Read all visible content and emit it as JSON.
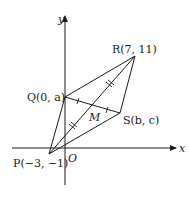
{
  "diagram": {
    "type": "coordinate-geometry",
    "axes": {
      "x_label": "x",
      "y_label": "y",
      "origin_label": "O"
    },
    "points": {
      "P": {
        "label": "P(−3, −1)",
        "coords": [
          -3,
          -1
        ]
      },
      "Q": {
        "label": "Q(0, a)",
        "coords": [
          "0",
          "a"
        ]
      },
      "R": {
        "label": "R(7, 11)",
        "coords": [
          7,
          11
        ]
      },
      "S": {
        "label": "S(b, c)",
        "coords": [
          "b",
          "c"
        ]
      },
      "M": {
        "label": "M",
        "note": "intersection of diagonals PR and QS"
      }
    },
    "segments": [
      "PQ",
      "QR",
      "RS",
      "SP",
      "PR",
      "QS"
    ],
    "tick_marks": {
      "PM_MR": "double ticks (equal lengths)",
      "QM_MS": "single ticks (equal lengths)"
    },
    "colors": {
      "stroke": "#1a1a1a",
      "background": "#ffffff"
    }
  }
}
